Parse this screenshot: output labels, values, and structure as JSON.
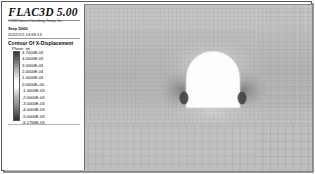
{
  "window": {
    "app_title": "FLAC3D 5.00",
    "copyright": "©2012 Itasca Consulting Group, Inc.",
    "step_label": "Step 5000",
    "date_label": "2022/1/2 13:59:13"
  },
  "legend": {
    "contour_title": "Contour Of X-Displacement",
    "plane_label": "Plane: on",
    "colorbar": {
      "top_color": "#3a3a3a",
      "mid_color": "#fbfbfb",
      "bottom_color": "#2e2e2e"
    },
    "scale_values": [
      "4.7000E-03",
      "4.0000E-03",
      "3.0000E-03",
      "2.0000E-03",
      "1.0000E-03",
      "0.0000E+00",
      "-1.0000E-03",
      "-2.0000E-03",
      "-3.0000E-03",
      "-4.0000E-03",
      "-5.0000E-03",
      "-6.1765E-03"
    ]
  },
  "plot": {
    "background_color": "#b9b9b9",
    "mesh_line_color": "#8e8e90",
    "excavation_fill": "#fdfdfd",
    "excavation_edge": "#cfcfcf"
  },
  "chart_data": {
    "type": "heatmap",
    "title": "Contour Of X-Displacement",
    "subtitle": "Plane: on",
    "xlabel": "",
    "ylabel": "",
    "colorbar_label": "X-Displacement (m)",
    "colorbar_ticks": [
      0.0047,
      0.004,
      0.003,
      0.002,
      0.001,
      0.0,
      -0.001,
      -0.002,
      -0.003,
      -0.004,
      -0.005,
      -0.0061765
    ],
    "vmin": -0.0061765,
    "vmax": 0.0047,
    "colormap": "grayscale",
    "grid": true,
    "legend_position": "left",
    "annotations": [
      "Step 5000",
      "2022/1/2 13:59:13"
    ],
    "features": [
      {
        "name": "tunnel-excavation",
        "shape": "arched-tunnel",
        "center_x_frac": 0.69,
        "center_y_frac": 0.45,
        "width_frac": 0.18,
        "height_frac": 0.35
      }
    ]
  }
}
